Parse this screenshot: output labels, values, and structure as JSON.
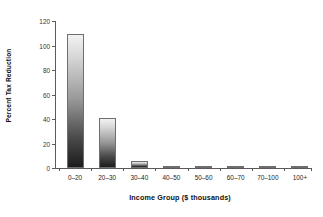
{
  "chart_data": {
    "type": "bar",
    "title": "",
    "categories": [
      "0–20",
      "20–30",
      "30–40",
      "40–50",
      "50–60",
      "60–70",
      "70–100",
      "100+"
    ],
    "values": [
      109,
      41,
      5.5,
      2,
      2,
      2,
      2,
      1.5
    ],
    "xlabel": "Income Group ($ thousands)",
    "ylabel": "Percent Tax Reduction",
    "ylim": [
      0,
      120
    ],
    "yticks": [
      0,
      20,
      40,
      60,
      80,
      100,
      120
    ],
    "ytick_labels": [
      "0",
      "20",
      "40",
      "60",
      "80",
      "100",
      "120"
    ],
    "grid": false,
    "legend": false,
    "legend_position": "none",
    "bar_fill_top_color": "#f2f2f2",
    "bar_fill_bottom_color": "#1c1c1c",
    "bar_edge_color": "#6e6e6e",
    "axis_color": "#5b5b5b",
    "background_color": "#ffffff"
  }
}
